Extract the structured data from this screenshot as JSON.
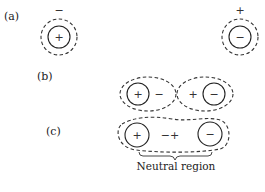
{
  "panels": {
    "a": {
      "label": "(a)",
      "left_atom": {
        "outer_sign": "−",
        "inner_sign": "+"
      },
      "right_atom": {
        "outer_sign": "+",
        "inner_sign": "−"
      }
    },
    "b": {
      "label": "(b)",
      "left_pair": {
        "inner_sign": "+",
        "outer_sign": "−"
      },
      "right_pair": {
        "outer_sign": "+",
        "inner_sign": "−"
      }
    },
    "c": {
      "label": "(c)",
      "left_inner_sign": "+",
      "middle_signs": "−+",
      "right_inner_sign": "−",
      "caption": "Neutral region"
    }
  }
}
